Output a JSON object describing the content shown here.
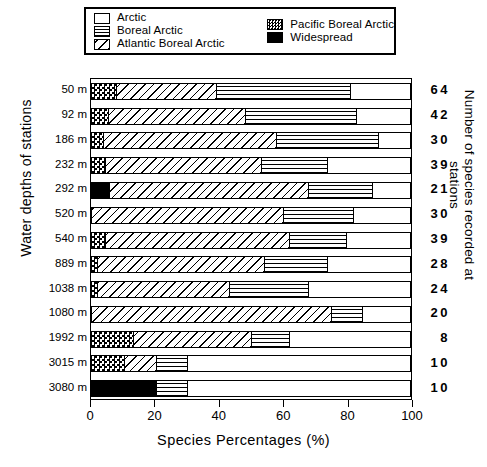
{
  "legend": {
    "entries": [
      {
        "label": "Arctic",
        "pattern": "arctic",
        "icon": "white-square-swatch"
      },
      {
        "label": "Boreal Arctic",
        "pattern": "boreal",
        "icon": "horizontal-lines-swatch"
      },
      {
        "label": "Atlantic Boreal Arctic",
        "pattern": "atlantic",
        "icon": "diagonal-lines-swatch"
      },
      {
        "label": "Pacific Boreal Arctic",
        "pattern": "pacific",
        "icon": "checkered-swatch"
      },
      {
        "label": "Widespread",
        "pattern": "widespread",
        "icon": "black-square-swatch"
      }
    ]
  },
  "axes": {
    "y_left_title": "Water depths of stations",
    "y_right_title": "Number of species recorded at stations",
    "x_title": "Species Percentages (%)",
    "x_ticks": [
      "0",
      "20",
      "40",
      "60",
      "80",
      "100"
    ],
    "x_tick_values": [
      0,
      20,
      40,
      60,
      80,
      100
    ]
  },
  "chart_data": {
    "type": "bar",
    "orientation": "horizontal",
    "stacked": true,
    "title": "",
    "xlabel": "Species Percentages (%)",
    "ylabel": "Water depths of stations",
    "xlim": [
      0,
      100
    ],
    "grid": false,
    "legend_position": "top",
    "categories": [
      "50 m",
      "92 m",
      "186 m",
      "232 m",
      "292 m",
      "520 m",
      "540 m",
      "889 m",
      "1038 m",
      "1080 m",
      "1992 m",
      "3015 m",
      "3080 m"
    ],
    "right_axis_label": "Number of species recorded at stations",
    "right_values": [
      64,
      42,
      30,
      39,
      21,
      30,
      39,
      28,
      24,
      20,
      8,
      10,
      10
    ],
    "series": [
      {
        "name": "Widespread",
        "pattern": "widespread",
        "values": [
          0,
          0,
          0,
          0,
          5.5,
          0,
          0,
          0,
          0,
          0,
          0,
          0,
          20
        ]
      },
      {
        "name": "Pacific Boreal Arctic",
        "pattern": "pacific",
        "values": [
          7.5,
          5,
          3.5,
          4,
          0,
          0,
          4,
          1.5,
          1.5,
          0,
          13,
          10,
          0
        ]
      },
      {
        "name": "Atlantic Boreal Arctic",
        "pattern": "atlantic",
        "values": [
          31.5,
          43,
          54.5,
          49,
          62.5,
          60,
          58,
          52.5,
          41.5,
          75,
          37,
          10,
          0
        ]
      },
      {
        "name": "Boreal Arctic",
        "pattern": "boreal",
        "values": [
          42,
          35,
          32,
          21,
          20,
          22,
          18,
          20,
          25,
          10,
          12,
          10,
          10
        ]
      },
      {
        "name": "Arctic",
        "pattern": "arctic",
        "values": [
          19,
          17,
          10,
          26,
          12,
          18,
          20,
          26,
          32,
          15,
          38,
          70,
          70
        ]
      }
    ]
  }
}
